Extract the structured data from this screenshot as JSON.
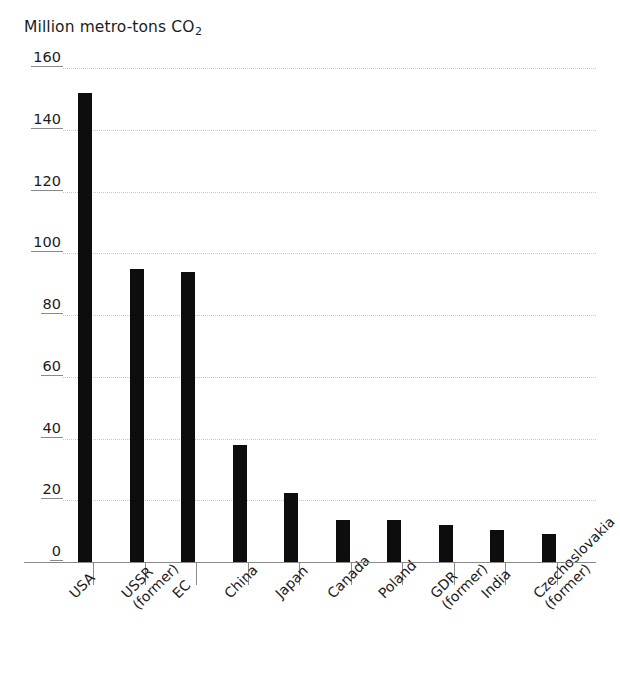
{
  "chart_data": {
    "type": "bar",
    "title": "Million metro-tons CO2",
    "title_main": "Million metro-tons CO",
    "title_sub": "2",
    "xlabel": "",
    "ylabel": "",
    "ylim": [
      0,
      160
    ],
    "yticks": [
      0,
      20,
      40,
      60,
      80,
      100,
      120,
      140,
      160
    ],
    "ytick_labels": [
      "0",
      "20",
      "40",
      "60",
      "80",
      "100",
      "120",
      "140",
      "160"
    ],
    "grid": true,
    "legend": "none",
    "bar_color": "#0d0d0d",
    "categories": [
      "USA",
      "USSR (former)",
      "EC",
      "China",
      "Japan",
      "Canada",
      "Poland",
      "GDR (former)",
      "India",
      "Czechoslovakia (former)"
    ],
    "category_lines": [
      [
        "USA",
        ""
      ],
      [
        "USSR",
        "(former)"
      ],
      [
        "EC",
        ""
      ],
      [
        "China",
        ""
      ],
      [
        "Japan",
        ""
      ],
      [
        "Canada",
        ""
      ],
      [
        "Poland",
        ""
      ],
      [
        "GDR",
        "(former)"
      ],
      [
        "India",
        ""
      ],
      [
        "Czechoslovakia",
        "(former)"
      ]
    ],
    "values": [
      152,
      95,
      94,
      38,
      22.5,
      13.5,
      13.5,
      12,
      10.5,
      9
    ]
  }
}
